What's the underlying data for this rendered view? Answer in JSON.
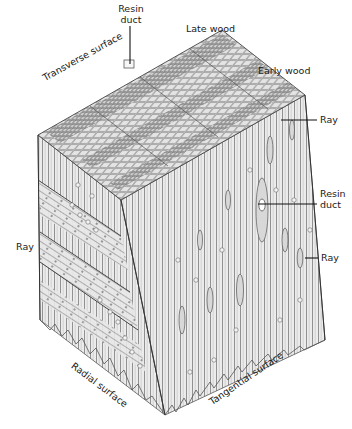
{
  "diagram": {
    "labels": {
      "resin_duct_top_line1": "Resin",
      "resin_duct_top_line2": "duct",
      "late_wood": "Late wood",
      "transverse_surface": "Transverse surface",
      "early_wood": "Early wood",
      "ray_right_top": "Ray",
      "resin_duct_right_line1": "Resin",
      "resin_duct_right_line2": "duct",
      "ray_right_bottom": "Ray",
      "ray_left": "Ray",
      "radial_surface": "Radial surface",
      "tangential_surface": "Tangential surface"
    },
    "colors": {
      "background": "#ffffff",
      "line": "#1a1a1a",
      "cell_fill": "#e9e9e9",
      "cell_stroke": "#8a8a8a",
      "shade": "#cfcfcf"
    }
  }
}
